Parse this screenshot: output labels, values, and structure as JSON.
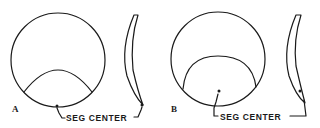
{
  "diagram": {
    "panels": [
      {
        "id": "A",
        "label": "A",
        "front_view": {
          "shape": "circle-lens",
          "segment": "arc-segment-lower",
          "seg_center_position": "on-lower-edge"
        },
        "side_view": {
          "shape": "crescent-profile",
          "seg_center_marker": "bottom-tip"
        },
        "callout": {
          "text": "SEG CENTER"
        }
      },
      {
        "id": "B",
        "label": "B",
        "front_view": {
          "shape": "circle-lens",
          "segment": "arc-segment-lower-taller",
          "seg_center_position": "inside-segment-above-edge"
        },
        "side_view": {
          "shape": "crescent-profile",
          "seg_center_marker": "near-bottom"
        },
        "callout": {
          "text": "SEG CENTER"
        }
      }
    ],
    "colors": {
      "ink": "#1a1a1a",
      "background": "#ffffff"
    }
  }
}
